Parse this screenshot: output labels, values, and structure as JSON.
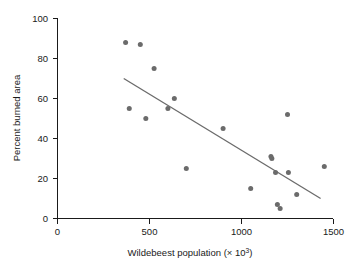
{
  "chart_data": {
    "type": "scatter",
    "title": "",
    "xlabel": "Wildebeest population (× 10³)",
    "ylabel": "Percent burned area",
    "xlim": [
      0,
      1500
    ],
    "ylim": [
      0,
      100
    ],
    "xticks": [
      0,
      500,
      1000,
      1500
    ],
    "yticks": [
      0,
      20,
      40,
      60,
      80,
      100
    ],
    "grid": false,
    "legend": "none",
    "point_color": "#6b6b6b",
    "line_color": "#6b6b6b",
    "axis_color": "#1a1a1a",
    "background": "#ffffff",
    "points": [
      {
        "x": 370,
        "y": 88
      },
      {
        "x": 390,
        "y": 55
      },
      {
        "x": 450,
        "y": 87
      },
      {
        "x": 480,
        "y": 50
      },
      {
        "x": 525,
        "y": 75
      },
      {
        "x": 600,
        "y": 55
      },
      {
        "x": 635,
        "y": 60
      },
      {
        "x": 700,
        "y": 25
      },
      {
        "x": 900,
        "y": 45
      },
      {
        "x": 1050,
        "y": 15
      },
      {
        "x": 1160,
        "y": 31
      },
      {
        "x": 1165,
        "y": 30
      },
      {
        "x": 1185,
        "y": 23
      },
      {
        "x": 1195,
        "y": 7
      },
      {
        "x": 1210,
        "y": 5
      },
      {
        "x": 1250,
        "y": 52
      },
      {
        "x": 1255,
        "y": 23
      },
      {
        "x": 1300,
        "y": 12
      },
      {
        "x": 1450,
        "y": 26
      }
    ],
    "trend_line": {
      "x1": 360,
      "y1": 70,
      "x2": 1430,
      "y2": 10
    }
  },
  "axis_labels": {
    "y_0": "0",
    "y_20": "20",
    "y_40": "40",
    "y_60": "60",
    "y_80": "80",
    "y_100": "100",
    "x_0": "0",
    "x_500": "500",
    "x_1000": "1000",
    "x_1500": "1500",
    "x_title_main": "Wildebeest population (× 10",
    "x_title_sup": "3",
    "x_title_close": ")",
    "y_title": "Percent burned area"
  }
}
